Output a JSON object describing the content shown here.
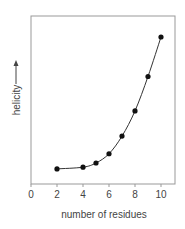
{
  "chart_data": {
    "type": "line",
    "title": "",
    "xlabel": "number of residues",
    "ylabel": "helicity",
    "ylabel_arrow": true,
    "x_ticks": [
      0,
      2,
      4,
      6,
      8,
      10
    ],
    "xlim": [
      0,
      11
    ],
    "ylim": [
      0,
      100
    ],
    "y_units": "relative (no numeric ticks shown)",
    "grid": false,
    "legend": null,
    "series": [
      {
        "name": "helicity",
        "markers": true,
        "smooth_curve": true,
        "x": [
          2,
          4,
          5,
          6,
          7,
          8,
          9,
          10
        ],
        "values": [
          9,
          10,
          12.5,
          18,
          28.5,
          43.5,
          64,
          87.5
        ]
      }
    ]
  },
  "colors": {
    "frame": "#999999",
    "line": "#333333",
    "marker": "#111111",
    "text": "#444444"
  }
}
